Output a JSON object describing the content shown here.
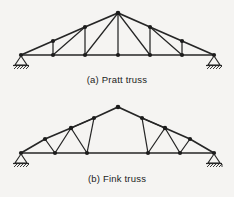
{
  "figure": {
    "background_color": "#f5f4f2",
    "line_color": "#262626",
    "joint_color": "#1c1c1c"
  },
  "captions": {
    "pratt": "(a)  Pratt truss",
    "fink": "(b)  Fink truss"
  },
  "diagram_data": {
    "type": "engineering-diagram",
    "subject": "roof truss configurations",
    "units": "px",
    "panels": [
      {
        "id": "pratt",
        "label": "(a)  Pratt truss",
        "span": 194,
        "rise": 42,
        "joints": {
          "bottom_chord": [
            {
              "name": "L0",
              "x": 21,
              "y": 55
            },
            {
              "name": "L1",
              "x": 53,
              "y": 55
            },
            {
              "name": "L2",
              "x": 85,
              "y": 55
            },
            {
              "name": "L3",
              "x": 118,
              "y": 55
            },
            {
              "name": "L4",
              "x": 150,
              "y": 55
            },
            {
              "name": "L5",
              "x": 182,
              "y": 55
            },
            {
              "name": "L6",
              "x": 214,
              "y": 55
            }
          ],
          "top_chord": [
            {
              "name": "U1",
              "x": 53,
              "y": 41
            },
            {
              "name": "U2",
              "x": 85,
              "y": 27
            },
            {
              "name": "U3",
              "x": 118,
              "y": 13
            },
            {
              "name": "U4",
              "x": 150,
              "y": 27
            },
            {
              "name": "U5",
              "x": 182,
              "y": 41
            }
          ]
        },
        "members": {
          "bottom_chord": [
            [
              "L0",
              "L1"
            ],
            [
              "L1",
              "L2"
            ],
            [
              "L2",
              "L3"
            ],
            [
              "L3",
              "L4"
            ],
            [
              "L4",
              "L5"
            ],
            [
              "L5",
              "L6"
            ]
          ],
          "top_chord": [
            [
              "L0",
              "U1"
            ],
            [
              "U1",
              "U2"
            ],
            [
              "U2",
              "U3"
            ],
            [
              "U3",
              "U4"
            ],
            [
              "U4",
              "U5"
            ],
            [
              "U5",
              "L6"
            ]
          ],
          "verticals": [
            [
              "U1",
              "L1"
            ],
            [
              "U2",
              "L2"
            ],
            [
              "U3",
              "L3"
            ],
            [
              "U4",
              "L4"
            ],
            [
              "U5",
              "L5"
            ]
          ],
          "diagonals": [
            [
              "L1",
              "U2"
            ],
            [
              "L2",
              "U3"
            ],
            [
              "L4",
              "U3"
            ],
            [
              "L5",
              "U4"
            ]
          ]
        },
        "supports": [
          {
            "type": "pin",
            "x": 21,
            "y": 55
          },
          {
            "type": "pin",
            "x": 214,
            "y": 55
          }
        ]
      },
      {
        "id": "fink",
        "label": "(b)  Fink truss",
        "span": 194,
        "rise": 42,
        "joints": {
          "bottom_chord": [
            {
              "name": "L0",
              "x": 21,
              "y": 55
            },
            {
              "name": "L1",
              "x": 55,
              "y": 55
            },
            {
              "name": "L2",
              "x": 87,
              "y": 55
            },
            {
              "name": "L3",
              "x": 148,
              "y": 55
            },
            {
              "name": "L4",
              "x": 180,
              "y": 55
            },
            {
              "name": "L5",
              "x": 214,
              "y": 55
            }
          ],
          "top_chord": [
            {
              "name": "U1",
              "x": 45,
              "y": 41
            },
            {
              "name": "U2",
              "x": 71,
              "y": 30
            },
            {
              "name": "U3",
              "x": 94,
              "y": 20
            },
            {
              "name": "U4",
              "x": 118,
              "y": 9
            },
            {
              "name": "U5",
              "x": 142,
              "y": 20
            },
            {
              "name": "U6",
              "x": 165,
              "y": 30
            },
            {
              "name": "U7",
              "x": 190,
              "y": 41
            }
          ]
        },
        "members": {
          "bottom_chord": [
            [
              "L0",
              "L1"
            ],
            [
              "L1",
              "L2"
            ],
            [
              "L2",
              "L3"
            ],
            [
              "L3",
              "L4"
            ],
            [
              "L4",
              "L5"
            ]
          ],
          "top_chord": [
            [
              "L0",
              "U1"
            ],
            [
              "U1",
              "U2"
            ],
            [
              "U2",
              "U3"
            ],
            [
              "U3",
              "U4"
            ],
            [
              "U4",
              "U5"
            ],
            [
              "U5",
              "U6"
            ],
            [
              "U6",
              "U7"
            ],
            [
              "U7",
              "L5"
            ]
          ],
          "web_left": [
            [
              "U1",
              "L1"
            ],
            [
              "L1",
              "U2"
            ],
            [
              "U2",
              "L2"
            ],
            [
              "L2",
              "U3"
            ],
            [
              "U2",
              "U3"
            ]
          ],
          "web_right": [
            [
              "U7",
              "L4"
            ],
            [
              "L4",
              "U6"
            ],
            [
              "U6",
              "L3"
            ],
            [
              "L3",
              "U5"
            ],
            [
              "U6",
              "U5"
            ]
          ]
        },
        "supports": [
          {
            "type": "pin",
            "x": 21,
            "y": 55
          },
          {
            "type": "pin",
            "x": 214,
            "y": 55
          }
        ]
      }
    ]
  }
}
